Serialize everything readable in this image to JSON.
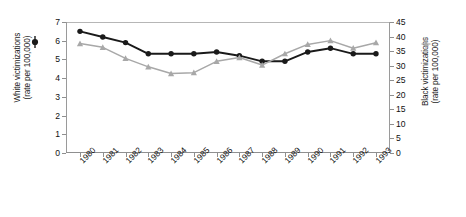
{
  "chart_data": {
    "type": "line",
    "title": "",
    "xlabel": "",
    "categories": [
      "1980",
      "1981",
      "1982",
      "1983",
      "1984",
      "1985",
      "1986",
      "1987",
      "1988",
      "1989",
      "1990",
      "1991",
      "1992",
      "1993"
    ],
    "grid": false,
    "legend_position": "axis-titles",
    "axes": {
      "left": {
        "label_line1": "White victimizations",
        "label_line2": "(rate per 100,000)",
        "min": 0,
        "max": 7,
        "step": 1,
        "ticks": [
          "0",
          "1",
          "2",
          "3",
          "4",
          "5",
          "6",
          "7"
        ]
      },
      "right": {
        "label_line1": "Black victimizations",
        "label_line2": "(rate per 100,000)",
        "min": 0,
        "max": 45,
        "step": 5,
        "ticks": [
          "0",
          "5",
          "10",
          "15",
          "20",
          "25",
          "30",
          "35",
          "40",
          "45"
        ]
      }
    },
    "series": [
      {
        "name": "White victimizations",
        "axis": "left",
        "marker": "filled-circle",
        "color": "#1a1a1a",
        "values": [
          6.5,
          6.2,
          5.9,
          5.3,
          5.3,
          5.3,
          5.4,
          5.2,
          4.9,
          4.9,
          5.4,
          5.6,
          5.3,
          5.3
        ]
      },
      {
        "name": "Black victimizations",
        "axis": "right",
        "marker": "filled-triangle",
        "color": "#a8a8a8",
        "values": [
          37.6,
          36.3,
          32.5,
          29.6,
          27.3,
          27.6,
          31.5,
          32.8,
          30.2,
          34.1,
          37.3,
          38.6,
          36.0,
          37.9
        ]
      }
    ]
  },
  "legend": {
    "white_marker_name": "black-filled-circle-marker",
    "black_marker_name": "gray-triangle-marker"
  },
  "colors": {
    "white_series": "#1a1a1a",
    "black_series": "#a8a8a8",
    "axis": "#8f8f8f",
    "background": "#ffffff"
  }
}
